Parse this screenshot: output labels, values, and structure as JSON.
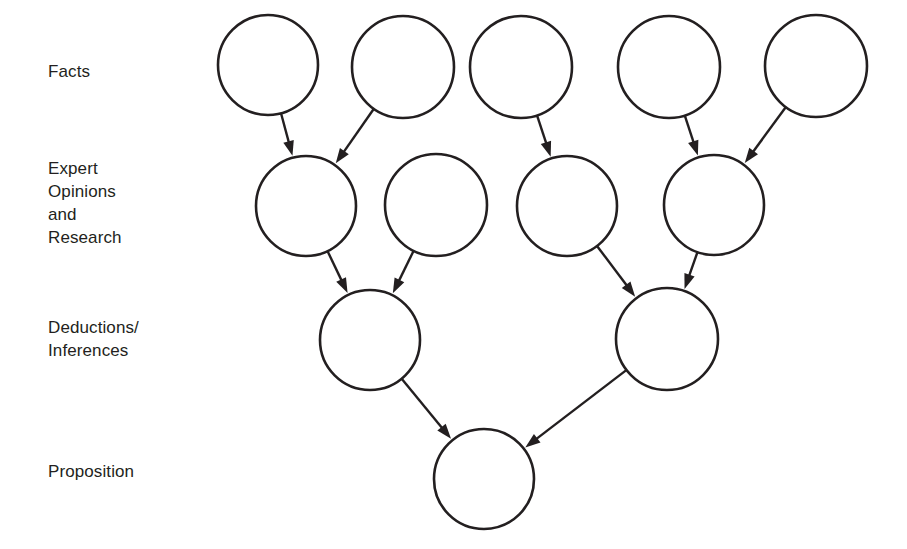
{
  "diagram": {
    "background_color": "#ffffff",
    "stroke_color": "#231f20",
    "text_color": "#231f20",
    "row_labels": [
      {
        "id": "facts",
        "text": "Facts",
        "x": 48,
        "y": 60
      },
      {
        "id": "expert-opinions-and-research",
        "text": "Expert\nOpinions\nand\nResearch",
        "x": 48,
        "y": 157
      },
      {
        "id": "deductions-inferences",
        "text": "Deductions/\nInferences",
        "x": 48,
        "y": 316
      },
      {
        "id": "proposition",
        "text": "Proposition",
        "x": 48,
        "y": 460
      }
    ],
    "nodes": [
      {
        "id": "fact-1",
        "row": "facts",
        "cx": 268,
        "cy": 65,
        "r": 50
      },
      {
        "id": "fact-2",
        "row": "facts",
        "cx": 403,
        "cy": 67,
        "r": 51
      },
      {
        "id": "fact-3",
        "row": "facts",
        "cx": 521,
        "cy": 67,
        "r": 51
      },
      {
        "id": "fact-4",
        "row": "facts",
        "cx": 669,
        "cy": 67,
        "r": 51
      },
      {
        "id": "fact-5",
        "row": "facts",
        "cx": 816,
        "cy": 66,
        "r": 51
      },
      {
        "id": "expert-1",
        "row": "expert-opinions-and-research",
        "cx": 306,
        "cy": 206,
        "r": 50
      },
      {
        "id": "expert-2",
        "row": "expert-opinions-and-research",
        "cx": 436,
        "cy": 205,
        "r": 51
      },
      {
        "id": "expert-3",
        "row": "expert-opinions-and-research",
        "cx": 567,
        "cy": 206,
        "r": 50
      },
      {
        "id": "expert-4",
        "row": "expert-opinions-and-research",
        "cx": 714,
        "cy": 205,
        "r": 50
      },
      {
        "id": "deduction-1",
        "row": "deductions-inferences",
        "cx": 370,
        "cy": 340,
        "r": 50
      },
      {
        "id": "deduction-2",
        "row": "deductions-inferences",
        "cx": 667,
        "cy": 339,
        "r": 51
      },
      {
        "id": "proposition-1",
        "row": "proposition",
        "cx": 484,
        "cy": 479,
        "r": 50
      }
    ],
    "edges": [
      {
        "from": "fact-1",
        "to": "expert-1"
      },
      {
        "from": "fact-2",
        "to": "expert-1"
      },
      {
        "from": "fact-3",
        "to": "expert-3"
      },
      {
        "from": "fact-4",
        "to": "expert-4"
      },
      {
        "from": "fact-5",
        "to": "expert-4"
      },
      {
        "from": "expert-1",
        "to": "deduction-1"
      },
      {
        "from": "expert-2",
        "to": "deduction-1"
      },
      {
        "from": "expert-3",
        "to": "deduction-2"
      },
      {
        "from": "expert-4",
        "to": "deduction-2"
      },
      {
        "from": "deduction-1",
        "to": "proposition-1"
      },
      {
        "from": "deduction-2",
        "to": "proposition-1"
      }
    ]
  }
}
